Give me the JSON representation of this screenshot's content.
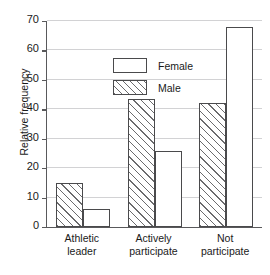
{
  "chart_data": {
    "type": "bar",
    "title": "",
    "subtitle": "",
    "xlabel": "",
    "ylabel": "Relative frequency",
    "categories": [
      "Athletic leader",
      "Actively participate",
      "Not participate"
    ],
    "category_lines": [
      [
        "Athletic",
        "leader"
      ],
      [
        "Actively",
        "participate"
      ],
      [
        "Not",
        "participate"
      ]
    ],
    "series": [
      {
        "name": "Male",
        "fill": "hatched",
        "values": [
          15.0,
          43.5,
          42.0
        ]
      },
      {
        "name": "Female",
        "fill": "empty",
        "values": [
          6.0,
          26.0,
          68.0
        ]
      }
    ],
    "series_draw_order": [
      "Male",
      "Female"
    ],
    "ylim": [
      0,
      70
    ],
    "yticks": [
      0,
      10,
      20,
      30,
      40,
      50,
      60,
      70
    ],
    "ytick_labels": [
      "0",
      "10",
      "20",
      "30",
      "40",
      "50",
      "60",
      "70"
    ],
    "grid": true,
    "grid_axis": "y",
    "legend_position": "upper-left-inside",
    "legend_entries": [
      {
        "label": "Female",
        "fill": "empty"
      },
      {
        "label": "Male",
        "fill": "hatched"
      }
    ],
    "colors": {
      "bar_edge": "#4a4a4c",
      "bar_face": "#ffffff",
      "hatch_line": "#6b6b6d",
      "gridline": "#d2d2d4",
      "axis": "#59595b",
      "text": "#1a1a1a",
      "background": "#ffffff",
      "bar_shadow": "#a9a9ab"
    }
  }
}
